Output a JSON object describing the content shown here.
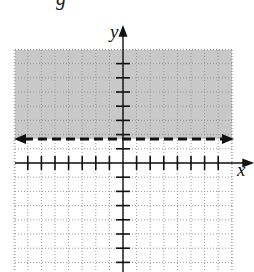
{
  "cropped_text_fragment": "g",
  "graph": {
    "x_axis_label": "x",
    "y_axis_label": "y",
    "x_range": [
      -8,
      8
    ],
    "y_range": [
      -8,
      8
    ],
    "tick_spacing": 1,
    "grid": "dotted",
    "boundary": {
      "type": "horizontal-line",
      "style": "dashed",
      "arrows": "both-ends",
      "equation": "y = 2"
    },
    "shaded_region": {
      "description": "region above the dashed boundary line",
      "inequality": "y > 2",
      "color": "#c8c8c8"
    }
  },
  "chart_data": {
    "type": "inequality-graph",
    "title": "",
    "xlabel": "x",
    "ylabel": "y",
    "xlim": [
      -8,
      8
    ],
    "ylim": [
      -8,
      8
    ],
    "x_ticks": [
      -7,
      -6,
      -5,
      -4,
      -3,
      -2,
      -1,
      1,
      2,
      3,
      4,
      5,
      6,
      7
    ],
    "y_ticks": [
      -7,
      -6,
      -5,
      -4,
      -3,
      -2,
      -1,
      1,
      2,
      3,
      4,
      5,
      6,
      7
    ],
    "grid": true,
    "lines": [
      {
        "equation": "y = 2",
        "style": "dashed",
        "arrows": "both"
      }
    ],
    "shading": {
      "inequality": "y > 2",
      "color": "#c8c8c8"
    }
  }
}
